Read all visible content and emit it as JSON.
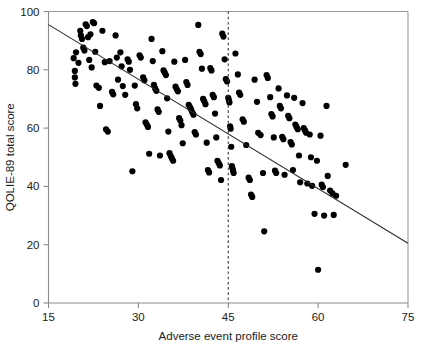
{
  "chart_data": {
    "type": "scatter",
    "title": "",
    "subtitle": "",
    "xlabel": "Adverse event profile score",
    "ylabel": "QOLIE-89 total score",
    "xlim": [
      15,
      75
    ],
    "ylim": [
      0,
      100
    ],
    "xticks": [
      15,
      30,
      45,
      60,
      75
    ],
    "yticks": [
      0,
      20,
      40,
      60,
      80,
      100
    ],
    "xtick_labels": [
      "15",
      "30",
      "45",
      "60",
      "75"
    ],
    "ytick_labels": [
      "0",
      "20",
      "40",
      "60",
      "80",
      "100"
    ],
    "grid": false,
    "legend": false,
    "legend_position": "none",
    "marker": "filled-circle",
    "marker_color": "#000000",
    "marker_size_px": 5.0,
    "annotations": [
      {
        "name": "adverse-event-threshold",
        "type": "vertical-dashed-line",
        "x": 45,
        "style": "dashed",
        "color": "#3a3a3a"
      },
      {
        "name": "regression-line",
        "type": "line",
        "x0": 15,
        "y0": 95.5,
        "x1": 75,
        "y1": 20.5,
        "color": "#2b2b2b"
      }
    ],
    "series": [
      {
        "name": "patients",
        "points": [
          [
            19.2,
            84.0
          ],
          [
            19.4,
            79.6
          ],
          [
            19.4,
            77.4
          ],
          [
            19.5,
            75.2
          ],
          [
            19.6,
            86.0
          ],
          [
            20.0,
            82.4
          ],
          [
            20.3,
            93.4
          ],
          [
            20.4,
            91.8
          ],
          [
            20.6,
            90.6
          ],
          [
            20.8,
            87.6
          ],
          [
            21.0,
            86.6
          ],
          [
            21.2,
            95.6
          ],
          [
            21.4,
            95.0
          ],
          [
            21.6,
            91.2
          ],
          [
            21.8,
            83.4
          ],
          [
            22.0,
            92.2
          ],
          [
            22.2,
            80.8
          ],
          [
            22.4,
            96.4
          ],
          [
            22.6,
            96.0
          ],
          [
            22.8,
            86.2
          ],
          [
            23.0,
            74.6
          ],
          [
            23.4,
            73.8
          ],
          [
            23.6,
            67.6
          ],
          [
            24.0,
            93.4
          ],
          [
            24.4,
            82.6
          ],
          [
            24.6,
            59.6
          ],
          [
            24.9,
            58.8
          ],
          [
            25.2,
            83.0
          ],
          [
            25.6,
            72.4
          ],
          [
            25.8,
            71.6
          ],
          [
            26.2,
            91.8
          ],
          [
            26.4,
            84.2
          ],
          [
            26.6,
            76.6
          ],
          [
            27.0,
            86.0
          ],
          [
            27.2,
            81.2
          ],
          [
            27.4,
            74.4
          ],
          [
            27.8,
            71.4
          ],
          [
            28.2,
            83.6
          ],
          [
            28.4,
            82.8
          ],
          [
            28.6,
            80.0
          ],
          [
            29.0,
            45.2
          ],
          [
            29.4,
            74.6
          ],
          [
            29.6,
            68.2
          ],
          [
            29.8,
            66.8
          ],
          [
            30.2,
            85.0
          ],
          [
            30.4,
            84.2
          ],
          [
            30.8,
            77.4
          ],
          [
            31.0,
            76.4
          ],
          [
            31.2,
            62.0
          ],
          [
            31.4,
            61.2
          ],
          [
            31.6,
            60.4
          ],
          [
            31.8,
            51.2
          ],
          [
            32.2,
            90.6
          ],
          [
            32.4,
            83.0
          ],
          [
            32.6,
            74.8
          ],
          [
            32.8,
            73.6
          ],
          [
            33.0,
            72.8
          ],
          [
            33.2,
            66.4
          ],
          [
            33.4,
            65.6
          ],
          [
            33.6,
            50.6
          ],
          [
            34.0,
            86.4
          ],
          [
            34.2,
            79.8
          ],
          [
            34.4,
            79.0
          ],
          [
            34.6,
            78.2
          ],
          [
            34.8,
            70.2
          ],
          [
            35.0,
            58.8
          ],
          [
            35.2,
            51.4
          ],
          [
            35.4,
            50.4
          ],
          [
            35.6,
            49.6
          ],
          [
            35.8,
            48.8
          ],
          [
            36.0,
            82.8
          ],
          [
            36.2,
            74.2
          ],
          [
            36.4,
            73.4
          ],
          [
            36.6,
            72.6
          ],
          [
            36.8,
            63.4
          ],
          [
            37.0,
            62.6
          ],
          [
            37.2,
            61.0
          ],
          [
            37.4,
            54.8
          ],
          [
            37.8,
            83.4
          ],
          [
            38.0,
            75.8
          ],
          [
            38.2,
            74.8
          ],
          [
            38.4,
            68.0
          ],
          [
            38.6,
            67.2
          ],
          [
            38.8,
            66.4
          ],
          [
            39.0,
            65.4
          ],
          [
            39.2,
            64.6
          ],
          [
            39.4,
            58.6
          ],
          [
            39.6,
            57.8
          ],
          [
            40.0,
            95.4
          ],
          [
            40.2,
            86.2
          ],
          [
            40.4,
            85.4
          ],
          [
            40.6,
            80.4
          ],
          [
            40.8,
            70.0
          ],
          [
            41.0,
            69.2
          ],
          [
            41.2,
            68.2
          ],
          [
            41.4,
            55.0
          ],
          [
            41.6,
            45.6
          ],
          [
            41.8,
            44.8
          ],
          [
            42.0,
            80.6
          ],
          [
            42.2,
            79.8
          ],
          [
            42.4,
            71.4
          ],
          [
            42.6,
            70.6
          ],
          [
            42.8,
            65.0
          ],
          [
            43.0,
            56.8
          ],
          [
            43.2,
            48.8
          ],
          [
            43.4,
            48.0
          ],
          [
            43.6,
            47.2
          ],
          [
            43.8,
            42.2
          ],
          [
            44.0,
            92.4
          ],
          [
            44.2,
            91.4
          ],
          [
            44.4,
            83.6
          ],
          [
            44.6,
            76.8
          ],
          [
            44.8,
            76.0
          ],
          [
            45.0,
            70.4
          ],
          [
            45.1,
            69.6
          ],
          [
            45.2,
            68.8
          ],
          [
            45.3,
            60.6
          ],
          [
            45.4,
            59.8
          ],
          [
            45.5,
            53.6
          ],
          [
            45.6,
            47.0
          ],
          [
            45.7,
            46.2
          ],
          [
            45.8,
            45.4
          ],
          [
            45.9,
            44.6
          ],
          [
            46.2,
            85.6
          ],
          [
            46.6,
            78.4
          ],
          [
            46.8,
            72.2
          ],
          [
            47.0,
            71.4
          ],
          [
            47.4,
            63.0
          ],
          [
            47.6,
            62.2
          ],
          [
            48.0,
            54.2
          ],
          [
            48.4,
            43.0
          ],
          [
            48.6,
            42.2
          ],
          [
            48.8,
            37.2
          ],
          [
            49.0,
            36.4
          ],
          [
            49.4,
            76.6
          ],
          [
            49.8,
            69.0
          ],
          [
            50.0,
            58.4
          ],
          [
            50.4,
            57.6
          ],
          [
            50.8,
            44.6
          ],
          [
            51.0,
            24.6
          ],
          [
            51.4,
            78.2
          ],
          [
            51.6,
            77.2
          ],
          [
            52.0,
            70.6
          ],
          [
            52.2,
            64.8
          ],
          [
            52.4,
            64.0
          ],
          [
            52.6,
            56.8
          ],
          [
            52.8,
            45.4
          ],
          [
            53.0,
            44.6
          ],
          [
            53.4,
            73.6
          ],
          [
            53.6,
            67.6
          ],
          [
            53.8,
            66.8
          ],
          [
            54.0,
            57.0
          ],
          [
            54.2,
            56.2
          ],
          [
            54.4,
            44.0
          ],
          [
            54.8,
            71.2
          ],
          [
            55.0,
            64.2
          ],
          [
            55.2,
            63.4
          ],
          [
            55.4,
            55.2
          ],
          [
            55.6,
            54.4
          ],
          [
            55.8,
            45.6
          ],
          [
            56.0,
            70.4
          ],
          [
            56.2,
            61.2
          ],
          [
            56.4,
            60.4
          ],
          [
            56.6,
            59.6
          ],
          [
            56.8,
            50.6
          ],
          [
            57.0,
            41.4
          ],
          [
            57.4,
            68.6
          ],
          [
            57.6,
            60.0
          ],
          [
            57.8,
            59.2
          ],
          [
            58.0,
            58.4
          ],
          [
            58.2,
            41.0
          ],
          [
            58.6,
            57.8
          ],
          [
            58.8,
            50.0
          ],
          [
            59.0,
            40.2
          ],
          [
            59.4,
            30.6
          ],
          [
            59.8,
            48.8
          ],
          [
            60.0,
            11.4
          ],
          [
            60.4,
            57.4
          ],
          [
            60.6,
            40.6
          ],
          [
            60.8,
            39.8
          ],
          [
            61.0,
            30.0
          ],
          [
            61.4,
            67.6
          ],
          [
            61.6,
            43.6
          ],
          [
            62.0,
            38.6
          ],
          [
            62.4,
            37.6
          ],
          [
            62.6,
            30.2
          ],
          [
            63.0,
            36.8
          ],
          [
            64.6,
            47.4
          ]
        ]
      }
    ]
  }
}
